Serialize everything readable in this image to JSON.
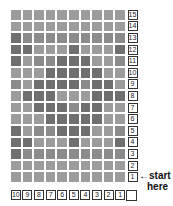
{
  "shades": {
    "L": "#9c9c9c",
    "M": "#8b8b8b",
    "D": "#6f6f6f"
  },
  "grid": {
    "rows_top_to_bottom": [
      "LLLLLLLLLL",
      "LLLLLLLLLL",
      "DMMMMMMMMM",
      "DDLLLDLLLD",
      "DLMMDDDLLM",
      "LLLDDDDDLL",
      "MLDDDDMDDL",
      "LDDDLLLDDD",
      "LLDDDMDDLL",
      "LLLDDDDDLL",
      "DLMMDDDLLM",
      "DDLLLDLLLD",
      "DMMMMMMMMM",
      "LLLLLLLLLL",
      "LLLLLLLLLL"
    ]
  },
  "row_labels": [
    "15",
    "14",
    "13",
    "12",
    "11",
    "10",
    "9",
    "8",
    "7",
    "6",
    "5",
    "4",
    "3",
    "2",
    "1"
  ],
  "column_labels": [
    "10",
    "9",
    "8",
    "7",
    "6",
    "5",
    "4",
    "3",
    "2",
    "1",
    ""
  ],
  "start_marker": {
    "arrow": "←",
    "line1": "start",
    "line2": "here"
  }
}
